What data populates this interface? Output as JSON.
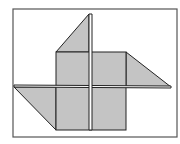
{
  "diagram": {
    "colors": {
      "fill": "#c4c4c4",
      "stroke": "#222222",
      "frame": "#555555",
      "background": "#ffffff"
    },
    "frame": {
      "x": 13,
      "y": 9,
      "w": 164,
      "h": 128
    },
    "square": {
      "x": 56,
      "y": 52,
      "w": 70,
      "h": 78
    },
    "triangles": [
      {
        "name": "top",
        "points": "56,52 89,14 89,52"
      },
      {
        "name": "right",
        "points": "126,52 171,87 126,87"
      },
      {
        "name": "bottom-left",
        "points": "14,87 56,130 56,87"
      }
    ],
    "bars": {
      "vertical": {
        "points": "89,14 92,14 92,130 89,130"
      },
      "horizontal": {
        "points": "14,85 171,86 171,88 14,87"
      }
    }
  }
}
